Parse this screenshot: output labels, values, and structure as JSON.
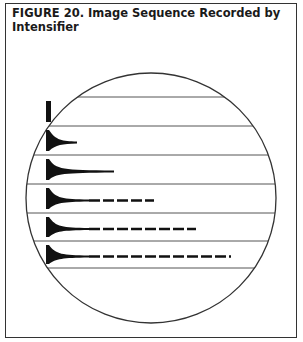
{
  "figure": {
    "caption": "FIGURE 20. Image Sequence Recorded by Intensifier",
    "caption_line1": "FIGURE 20. Image Sequence Recorded by",
    "caption_line2": "Intensifier",
    "circle": {
      "cx": 151,
      "cy": 198,
      "r": 125,
      "stroke": "#333333"
    },
    "lines_y": [
      97,
      126,
      155,
      184,
      213,
      241,
      268
    ],
    "frames": [
      {
        "index": 1,
        "description": "vertical bar only",
        "tail_length": 0,
        "dashed_trail": false
      },
      {
        "index": 2,
        "description": "short tapering tail",
        "tail_length": 28,
        "dashed_trail": false
      },
      {
        "index": 3,
        "description": "longer tapering tail",
        "tail_length": 65,
        "dashed_trail": false
      },
      {
        "index": 4,
        "description": "tail with dashed trail",
        "tail_length": 108,
        "dashed_trail": true
      },
      {
        "index": 5,
        "description": "tail with longer dashed trail",
        "tail_length": 150,
        "dashed_trail": true
      },
      {
        "index": 6,
        "description": "tail with longest dashed trail",
        "tail_length": 185,
        "dashed_trail": true
      }
    ],
    "ink_color": "#111111"
  }
}
